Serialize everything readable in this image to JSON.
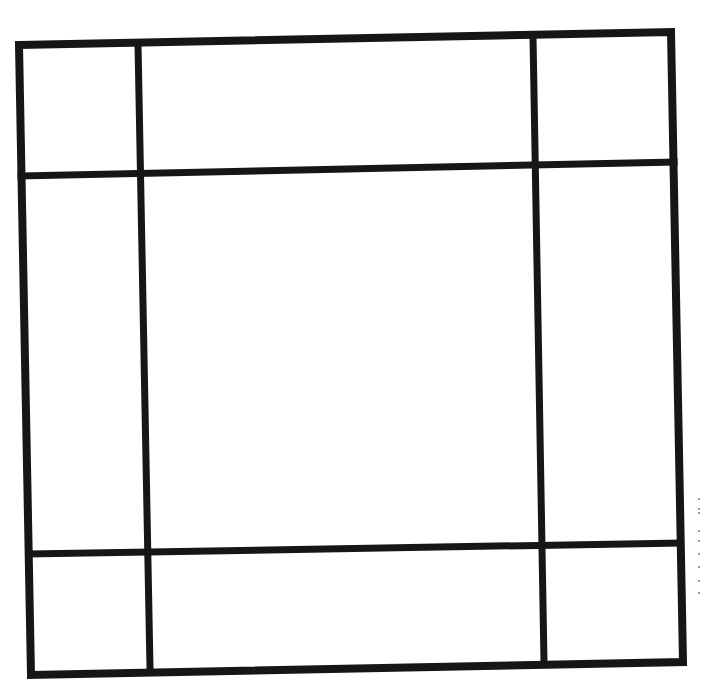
{
  "diagram": {
    "type": "3x3 grid",
    "rows": 3,
    "columns": 3,
    "line_color": "#161616",
    "background_color": "#ffffff",
    "outer_frame": {
      "points": [
        [
          19,
          45
        ],
        [
          671,
          32
        ],
        [
          683,
          662
        ],
        [
          31,
          675
        ]
      ]
    },
    "vertical_lines": [
      {
        "x1": 138,
        "y1": 44,
        "x2": 150,
        "y2": 668
      },
      {
        "x1": 533,
        "y1": 36,
        "x2": 544,
        "y2": 662
      }
    ],
    "horizontal_lines": [
      {
        "x1": 21,
        "y1": 176,
        "x2": 674,
        "y2": 162
      },
      {
        "x1": 29,
        "y1": 554,
        "x2": 680,
        "y2": 543
      }
    ],
    "cells": [
      {
        "row": 1,
        "col": 1,
        "label": ""
      },
      {
        "row": 1,
        "col": 2,
        "label": ""
      },
      {
        "row": 1,
        "col": 3,
        "label": ""
      },
      {
        "row": 2,
        "col": 1,
        "label": ""
      },
      {
        "row": 2,
        "col": 2,
        "label": ""
      },
      {
        "row": 2,
        "col": 3,
        "label": ""
      },
      {
        "row": 3,
        "col": 1,
        "label": ""
      },
      {
        "row": 3,
        "col": 2,
        "label": ""
      },
      {
        "row": 3,
        "col": 3,
        "label": ""
      }
    ],
    "scan_specks": [
      [
        698,
        498
      ],
      [
        698,
        508
      ],
      [
        698,
        512
      ],
      [
        698,
        530
      ],
      [
        698,
        540
      ],
      [
        698,
        553
      ],
      [
        698,
        566
      ],
      [
        698,
        580
      ],
      [
        698,
        592
      ]
    ]
  }
}
